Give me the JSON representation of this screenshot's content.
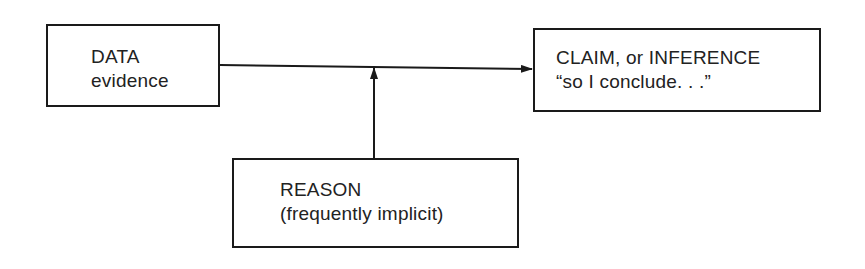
{
  "diagram": {
    "type": "argument-structure",
    "nodes": {
      "data": {
        "lines": [
          "DATA",
          "evidence"
        ]
      },
      "claim": {
        "lines": [
          "CLAIM, or INFERENCE",
          "“so I conclude. . .”"
        ]
      },
      "reason": {
        "lines": [
          "REASON",
          "(frequently implicit)"
        ]
      }
    },
    "edges": [
      {
        "from": "data",
        "to": "claim",
        "style": "arrow"
      },
      {
        "from": "reason",
        "to": "data-claim-edge",
        "style": "arrow"
      }
    ],
    "colors": {
      "stroke": "#1a1a1a",
      "text": "#222222",
      "background": "#ffffff"
    }
  }
}
